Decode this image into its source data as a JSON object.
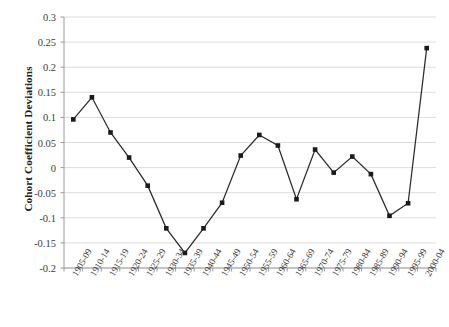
{
  "chart_data": {
    "type": "line",
    "title": "",
    "xlabel": "",
    "ylabel": "Cohort Coefficient Deviations",
    "ylim": [
      -0.2,
      0.3
    ],
    "ytick_step": 0.05,
    "yticks": [
      "0.3",
      "0.25",
      "0.2",
      "0.15",
      "0.1",
      "0.05",
      "0",
      "-0.05",
      "-0.1",
      "-0.15",
      "-0.2"
    ],
    "ytick_values": [
      0.3,
      0.25,
      0.2,
      0.15,
      0.1,
      0.05,
      0,
      -0.05,
      -0.1,
      -0.15,
      -0.2
    ],
    "grid": "horizontal",
    "legend": "none",
    "marker": "square",
    "line_color": "#2b2b2b",
    "marker_color": "#1a1a1a",
    "grid_color": "#d9d9d9",
    "axis_color": "#9a9a9a",
    "categories": [
      "1905-09",
      "1910-14",
      "1915-19",
      "1920-24",
      "1925-29",
      "1930-34",
      "1935-39",
      "1940-44",
      "1945-49",
      "1950-54",
      "1955-59",
      "1960-64",
      "1965-69",
      "1970-74",
      "1975-79",
      "1980-84",
      "1985-89",
      "1990-94",
      "1995-99",
      "2000-04"
    ],
    "values": [
      0.096,
      0.14,
      0.07,
      0.02,
      -0.036,
      -0.121,
      -0.17,
      -0.121,
      -0.07,
      0.024,
      0.065,
      0.044,
      -0.063,
      0.036,
      -0.01,
      0.022,
      -0.013,
      -0.096,
      -0.071,
      0.238
    ]
  }
}
